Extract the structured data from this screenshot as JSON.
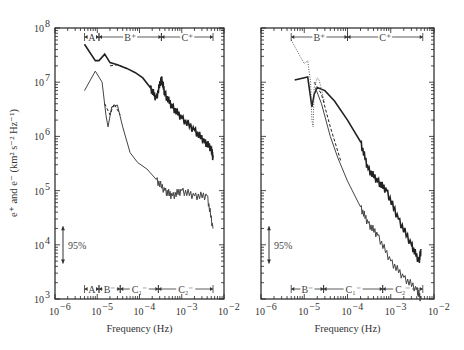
{
  "chart_data": [
    {
      "panel": "left",
      "type": "line",
      "xscale": "log",
      "yscale": "log",
      "xlim": [
        1e-06,
        0.01
      ],
      "ylim": [
        1000.0,
        100000000.0
      ],
      "xlabel": "Frequency (Hz)",
      "ylabel": "e⁺ and e⁻ (km² s⁻² Hz⁻¹)",
      "x_ticks": [
        "10⁻⁶",
        "10⁻⁵",
        "10⁻⁴",
        "10⁻³",
        "10⁻²"
      ],
      "y_ticks": [
        "10³",
        "10⁴",
        "10⁵",
        "10⁶",
        "10⁷",
        "10⁸"
      ],
      "confidence_label": "95%",
      "top_bands": [
        {
          "label": "A",
          "from": 5e-06,
          "to": 1.1e-05
        },
        {
          "label": "B⁺",
          "from": 1.1e-05,
          "to": 0.00033
        },
        {
          "label": "C⁺",
          "from": 0.00033,
          "to": 0.0055
        }
      ],
      "bottom_bands": [
        {
          "label": "A",
          "from": 5e-06,
          "to": 1.1e-05
        },
        {
          "label": "B⁻",
          "from": 1.1e-05,
          "to": 3.5e-05
        },
        {
          "label": "C₁⁻",
          "from": 3.5e-05,
          "to": 0.00028
        },
        {
          "label": "C₂⁻",
          "from": 0.00028,
          "to": 0.0055
        }
      ],
      "series": [
        {
          "name": "e+",
          "style": "solid-thick",
          "points": [
            [
              5e-06,
              50000000.0
            ],
            [
              9e-06,
              25000000.0
            ],
            [
              1.1e-05,
              25000000.0
            ],
            [
              1.5e-05,
              33000000.0
            ],
            [
              2e-05,
              23000000.0
            ],
            [
              3e-05,
              21000000.0
            ],
            [
              5e-05,
              18000000.0
            ],
            [
              8e-05,
              15000000.0
            ],
            [
              0.00012,
              12000000.0
            ],
            [
              0.00018,
              8000000.0
            ],
            [
              0.00025,
              5000000.0
            ],
            [
              0.00033,
              12000000.0
            ],
            [
              0.0004,
              6000000.0
            ],
            [
              0.0006,
              3500000.0
            ],
            [
              0.001,
              2200000.0
            ],
            [
              0.002,
              1300000.0
            ],
            [
              0.0035,
              800000.0
            ],
            [
              0.005,
              600000.0
            ],
            [
              0.0055,
              400000.0
            ]
          ]
        },
        {
          "name": "e+ (dashed)",
          "style": "dashed",
          "points": [
            [
              2e-05,
              20000000.0
            ],
            [
              3e-05,
              21000000.0
            ],
            [
              5e-05,
              18000000.0
            ]
          ]
        },
        {
          "name": "e-",
          "style": "solid-thin",
          "points": [
            [
              5e-06,
              7000000.0
            ],
            [
              9e-06,
              16000000.0
            ],
            [
              1.3e-05,
              10000000.0
            ],
            [
              1.6e-05,
              2500000.0
            ],
            [
              1.8e-05,
              1500000.0
            ],
            [
              2.2e-05,
              3500000.0
            ],
            [
              3e-05,
              3800000.0
            ],
            [
              4e-05,
              1500000.0
            ],
            [
              6e-05,
              500000.0
            ],
            [
              9e-05,
              330000.0
            ],
            [
              0.00015,
              250000.0
            ],
            [
              0.00025,
              160000.0
            ],
            [
              0.0004,
              100000.0
            ],
            [
              0.0006,
              80000.0
            ],
            [
              0.001,
              100000.0
            ],
            [
              0.002,
              80000.0
            ],
            [
              0.004,
              80000.0
            ],
            [
              0.0055,
              20000.0
            ]
          ]
        },
        {
          "name": "e- (dashed)",
          "style": "dashed",
          "points": [
            [
              1.5e-05,
              4000000.0
            ],
            [
              2e-05,
              2500000.0
            ],
            [
              2.5e-05,
              4000000.0
            ],
            [
              3.5e-05,
              2500000.0
            ]
          ]
        }
      ]
    },
    {
      "panel": "right",
      "type": "line",
      "xscale": "log",
      "yscale": "log",
      "xlim": [
        1e-06,
        0.01
      ],
      "ylim": [
        1000.0,
        100000000.0
      ],
      "xlabel": "Frequency (Hz)",
      "x_ticks": [
        "10⁻⁶",
        "10⁻⁵",
        "10⁻⁴",
        "10⁻³",
        "10⁻²"
      ],
      "confidence_label": "95%",
      "top_bands": [
        {
          "label": "B⁺",
          "from": 5e-06,
          "to": 0.0001
        },
        {
          "label": "C⁺",
          "from": 0.0001,
          "to": 0.0055
        }
      ],
      "bottom_bands": [
        {
          "label": "B⁻",
          "from": 5e-06,
          "to": 2.8e-05
        },
        {
          "label": "C₁⁻",
          "from": 2.8e-05,
          "to": 0.00065
        },
        {
          "label": "C₂⁻",
          "from": 0.00065,
          "to": 0.0055
        }
      ],
      "series": [
        {
          "name": "e+",
          "style": "solid-thick",
          "points": [
            [
              6e-06,
              11000000.0
            ],
            [
              1.2e-05,
              12500000.0
            ],
            [
              1.5e-05,
              3500000.0
            ],
            [
              1.7e-05,
              6000000.0
            ],
            [
              2e-05,
              8000000.0
            ],
            [
              3e-05,
              7000000.0
            ],
            [
              5e-05,
              4500000.0
            ],
            [
              0.0001,
              2000000.0
            ],
            [
              0.0002,
              800000.0
            ],
            [
              0.0003,
              250000.0
            ],
            [
              0.0005,
              150000.0
            ],
            [
              0.0008,
              100000.0
            ],
            [
              0.0015,
              30000.0
            ],
            [
              0.003,
              10000.0
            ],
            [
              0.0045,
              5000.0
            ],
            [
              0.005,
              8000.0
            ]
          ]
        },
        {
          "name": "e+ (dotted)",
          "style": "dotted",
          "points": [
            [
              5e-06,
              60000000.0
            ],
            [
              8e-06,
              30000000.0
            ],
            [
              1e-05,
              22000000.0
            ],
            [
              1.2e-05,
              25000000.0
            ],
            [
              1.4e-05,
              10000000.0
            ],
            [
              1.5e-05,
              2000000.0
            ],
            [
              1.6e-05,
              1500000.0
            ],
            [
              1.7e-05,
              8000000.0
            ],
            [
              2e-05,
              12000000.0
            ],
            [
              2.2e-05,
              11000000.0
            ],
            [
              3e-05,
              4000000.0
            ]
          ]
        },
        {
          "name": "e-",
          "style": "solid-thin",
          "points": [
            [
              1.8e-05,
              8000000.0
            ],
            [
              2.5e-05,
              4000000.0
            ],
            [
              4e-05,
              1000000.0
            ],
            [
              6e-05,
              400000.0
            ],
            [
              0.0001,
              150000.0
            ],
            [
              0.0002,
              50000.0
            ],
            [
              0.0003,
              25000.0
            ],
            [
              0.0005,
              15000.0
            ],
            [
              0.001,
              5000.0
            ],
            [
              0.002,
              2500.0
            ],
            [
              0.004,
              1500.0
            ],
            [
              0.005,
              1000.0
            ]
          ]
        },
        {
          "name": "e- (dashed)",
          "style": "dashed",
          "points": [
            [
              1.7e-05,
              10000000.0
            ],
            [
              2.5e-05,
              6000000.0
            ],
            [
              4e-05,
              1500000.0
            ],
            [
              7e-05,
              350000.0
            ]
          ]
        }
      ]
    }
  ],
  "labels": {
    "ylabel": "e⁺ and e⁻ (km² s⁻² Hz⁻¹)",
    "xlabel_left": "Frequency (Hz)",
    "xlabel_right": "Frequency (Hz)",
    "conf_left": "95%",
    "conf_right": "95%",
    "xt": [
      "10",
      "10",
      "10",
      "10",
      "10"
    ],
    "xt_exp": [
      "−6",
      "−5",
      "−4",
      "−3",
      "−2"
    ],
    "yt_exp": [
      "3",
      "4",
      "5",
      "6",
      "7",
      "8"
    ]
  }
}
